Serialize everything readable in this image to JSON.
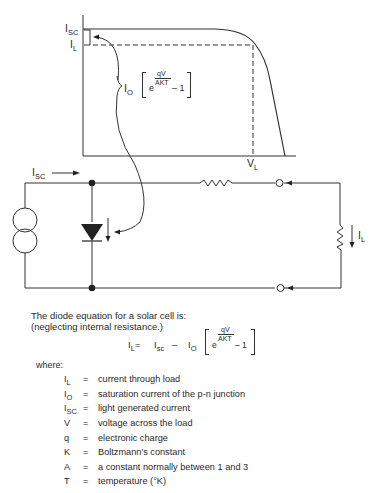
{
  "graph": {
    "y_labels": {
      "isc": "I",
      "isc_sub": "SC",
      "il": "I",
      "il_sub": "L"
    },
    "x_label": {
      "v": "V",
      "v_sub": "L"
    },
    "annotation": {
      "io": "I",
      "io_sub": "O",
      "exp_base": "e",
      "exp_num": "qV",
      "exp_den": "AKT",
      "minus_one": "– 1"
    }
  },
  "circuit": {
    "source_current_label": {
      "main": "I",
      "sub": "SC"
    },
    "load_current_label": {
      "main": "I",
      "sub": "L"
    }
  },
  "text": {
    "intro_line1": "The diode equation for a solar cell is:",
    "intro_line2": "(neglecting internal resistance.)",
    "equation": {
      "lhs": "I",
      "lhs_sub": "L",
      "eq": "= ",
      "term1": "I",
      "term1_sub": "sc",
      "minus": " – ",
      "term2": "I",
      "term2_sub": "O",
      "exp_base": "e",
      "exp_num": "qV",
      "exp_den": "AKT",
      "minus_one": "– 1"
    },
    "where": "where:"
  },
  "definitions": [
    {
      "sym": "I",
      "sub": "L",
      "eq": "=",
      "desc": "current through load"
    },
    {
      "sym": "I",
      "sub": "O",
      "eq": "=",
      "desc": "saturation current of the p-n junction"
    },
    {
      "sym": "I",
      "sub": "SC",
      "eq": "=",
      "desc": "light generated current"
    },
    {
      "sym": "V",
      "sub": "",
      "eq": "=",
      "desc": "voltage across the load"
    },
    {
      "sym": "q",
      "sub": "",
      "eq": "=",
      "desc": "electronic charge"
    },
    {
      "sym": "K",
      "sub": "",
      "eq": "=",
      "desc": "Boltzmann's constant"
    },
    {
      "sym": "A",
      "sub": "",
      "eq": "=",
      "desc": "a constant normally between 1 and 3"
    },
    {
      "sym": "T",
      "sub": "",
      "eq": "=",
      "desc": "temperature (°K)"
    }
  ]
}
